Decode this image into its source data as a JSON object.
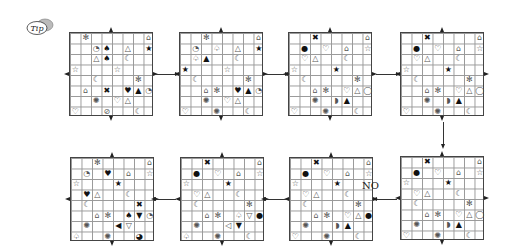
{
  "tip_label": "Tip",
  "no_label": "NO",
  "grids": [
    {
      "id": "g1",
      "x": 69,
      "y": 32,
      "cells": [
        [
          0,
          1,
          "✻"
        ],
        [
          0,
          7,
          "⌂"
        ],
        [
          1,
          2,
          "◔"
        ],
        [
          1,
          3,
          "♠"
        ],
        [
          1,
          5,
          "△"
        ],
        [
          1,
          7,
          "★"
        ],
        [
          2,
          2,
          "△"
        ],
        [
          2,
          3,
          "♠"
        ],
        [
          2,
          5,
          "☾"
        ],
        [
          3,
          0,
          "☆"
        ],
        [
          3,
          4,
          "☆"
        ],
        [
          4,
          2,
          "☾"
        ],
        [
          4,
          6,
          "✻"
        ],
        [
          5,
          1,
          "⌂"
        ],
        [
          5,
          3,
          "✖"
        ],
        [
          5,
          5,
          "♥"
        ],
        [
          5,
          6,
          "▲"
        ],
        [
          5,
          7,
          "◔"
        ],
        [
          6,
          2,
          "✺"
        ],
        [
          6,
          4,
          "♡"
        ],
        [
          6,
          5,
          "△"
        ],
        [
          7,
          0,
          "♡"
        ],
        [
          7,
          3,
          "⊘"
        ],
        [
          7,
          6,
          "☾"
        ]
      ]
    },
    {
      "id": "g2",
      "x": 179,
      "y": 32,
      "cells": [
        [
          0,
          2,
          "✻"
        ],
        [
          0,
          7,
          "⌂"
        ],
        [
          1,
          1,
          "◔"
        ],
        [
          1,
          3,
          "♤"
        ],
        [
          1,
          5,
          "△"
        ],
        [
          1,
          7,
          "★"
        ],
        [
          2,
          1,
          "♤"
        ],
        [
          2,
          2,
          "▲"
        ],
        [
          2,
          5,
          "☾"
        ],
        [
          3,
          0,
          "★"
        ],
        [
          3,
          4,
          "☆"
        ],
        [
          4,
          1,
          "☾"
        ],
        [
          4,
          6,
          "✻"
        ],
        [
          5,
          2,
          "⌂"
        ],
        [
          5,
          3,
          "✻"
        ],
        [
          5,
          5,
          "♥"
        ],
        [
          5,
          6,
          "▲"
        ],
        [
          5,
          7,
          "◔"
        ],
        [
          6,
          2,
          "✺"
        ],
        [
          6,
          4,
          "♡"
        ],
        [
          6,
          5,
          "△"
        ],
        [
          7,
          0,
          "♡"
        ],
        [
          7,
          3,
          "✺"
        ],
        [
          7,
          6,
          "☾"
        ]
      ]
    },
    {
      "id": "g3",
      "x": 288,
      "y": 32,
      "cells": [
        [
          0,
          2,
          "✖"
        ],
        [
          0,
          7,
          "⌂"
        ],
        [
          1,
          1,
          "●"
        ],
        [
          1,
          3,
          "♡"
        ],
        [
          1,
          5,
          "⌂"
        ],
        [
          1,
          7,
          "☆"
        ],
        [
          2,
          1,
          "♡"
        ],
        [
          2,
          2,
          "△"
        ],
        [
          2,
          5,
          "☾"
        ],
        [
          3,
          0,
          "☆"
        ],
        [
          3,
          4,
          "★"
        ],
        [
          4,
          1,
          "☾"
        ],
        [
          4,
          6,
          "✻"
        ],
        [
          5,
          2,
          "⌂"
        ],
        [
          5,
          3,
          "✻"
        ],
        [
          5,
          5,
          "♡"
        ],
        [
          5,
          6,
          "△"
        ],
        [
          5,
          7,
          "◯"
        ],
        [
          6,
          2,
          "✺"
        ],
        [
          6,
          4,
          "◗"
        ],
        [
          6,
          5,
          "▲"
        ],
        [
          7,
          0,
          "♡"
        ],
        [
          7,
          3,
          "✺"
        ],
        [
          7,
          6,
          "☾"
        ]
      ]
    },
    {
      "id": "g4",
      "x": 400,
      "y": 32,
      "cells": [
        [
          0,
          2,
          "✖"
        ],
        [
          0,
          7,
          "⌂"
        ],
        [
          1,
          1,
          "●"
        ],
        [
          1,
          3,
          "♡"
        ],
        [
          1,
          5,
          "⌂"
        ],
        [
          1,
          7,
          "☆"
        ],
        [
          2,
          1,
          "♡"
        ],
        [
          2,
          2,
          "△"
        ],
        [
          2,
          5,
          "☾"
        ],
        [
          3,
          0,
          "☆"
        ],
        [
          3,
          4,
          "★"
        ],
        [
          4,
          1,
          "☾"
        ],
        [
          4,
          6,
          "✻"
        ],
        [
          5,
          2,
          "⌂"
        ],
        [
          5,
          3,
          "✻"
        ],
        [
          5,
          5,
          "♡"
        ],
        [
          5,
          6,
          "△"
        ],
        [
          5,
          7,
          "◯"
        ],
        [
          6,
          2,
          "✺"
        ],
        [
          6,
          4,
          "◗"
        ],
        [
          6,
          5,
          "▲"
        ],
        [
          7,
          0,
          "♡"
        ],
        [
          7,
          3,
          "✺"
        ],
        [
          7,
          6,
          "☾"
        ]
      ]
    },
    {
      "id": "g5",
      "x": 70,
      "y": 157,
      "cells": [
        [
          0,
          2,
          "✻"
        ],
        [
          0,
          7,
          "⌂"
        ],
        [
          1,
          1,
          "◔"
        ],
        [
          1,
          3,
          "♥"
        ],
        [
          1,
          5,
          "⌂"
        ],
        [
          1,
          7,
          "☆"
        ],
        [
          2,
          0,
          "☆"
        ],
        [
          2,
          4,
          "★"
        ],
        [
          3,
          1,
          "♥"
        ],
        [
          3,
          2,
          "△"
        ],
        [
          3,
          5,
          "☾"
        ],
        [
          4,
          1,
          "☾"
        ],
        [
          4,
          6,
          "✖"
        ],
        [
          5,
          2,
          "⌂"
        ],
        [
          5,
          3,
          "✻"
        ],
        [
          5,
          5,
          "♠"
        ],
        [
          5,
          6,
          "▼"
        ],
        [
          5,
          7,
          "◔"
        ],
        [
          6,
          1,
          "✺"
        ],
        [
          6,
          4,
          "◀"
        ],
        [
          6,
          5,
          "▽"
        ],
        [
          7,
          0,
          "♤"
        ],
        [
          7,
          3,
          "✺"
        ],
        [
          7,
          6,
          "◕"
        ]
      ]
    },
    {
      "id": "g6",
      "x": 180,
      "y": 157,
      "cells": [
        [
          0,
          2,
          "✖"
        ],
        [
          0,
          7,
          "⌂"
        ],
        [
          1,
          1,
          "●"
        ],
        [
          1,
          3,
          "♡"
        ],
        [
          1,
          5,
          "⌂"
        ],
        [
          1,
          7,
          "☆"
        ],
        [
          2,
          0,
          "☆"
        ],
        [
          2,
          4,
          "★"
        ],
        [
          3,
          1,
          "♡"
        ],
        [
          3,
          2,
          "△"
        ],
        [
          3,
          5,
          "☾"
        ],
        [
          4,
          1,
          "☾"
        ],
        [
          4,
          6,
          "✻"
        ],
        [
          5,
          2,
          "⌂"
        ],
        [
          5,
          3,
          "✻"
        ],
        [
          5,
          5,
          "♤"
        ],
        [
          5,
          6,
          "▽"
        ],
        [
          5,
          7,
          "●"
        ],
        [
          6,
          1,
          "✺"
        ],
        [
          6,
          4,
          "◁"
        ],
        [
          6,
          5,
          "▼"
        ],
        [
          7,
          0,
          "♤"
        ],
        [
          7,
          3,
          "✺"
        ],
        [
          7,
          6,
          "☾"
        ]
      ]
    },
    {
      "id": "g7",
      "x": 289,
      "y": 157,
      "cells": [
        [
          0,
          2,
          "✖"
        ],
        [
          0,
          7,
          "⌂"
        ],
        [
          1,
          1,
          "●"
        ],
        [
          1,
          3,
          "♡"
        ],
        [
          1,
          5,
          "⌂"
        ],
        [
          1,
          7,
          "☆"
        ],
        [
          2,
          0,
          "☆"
        ],
        [
          2,
          4,
          "★"
        ],
        [
          3,
          1,
          "♡"
        ],
        [
          3,
          2,
          "△"
        ],
        [
          3,
          5,
          "☾"
        ],
        [
          4,
          1,
          "☾"
        ],
        [
          4,
          6,
          "✻"
        ],
        [
          5,
          2,
          "⌂"
        ],
        [
          5,
          3,
          "✻"
        ],
        [
          5,
          5,
          "♡"
        ],
        [
          5,
          6,
          "△"
        ],
        [
          5,
          7,
          "●"
        ],
        [
          6,
          1,
          "✺"
        ],
        [
          6,
          4,
          "◗"
        ],
        [
          6,
          5,
          "▲"
        ],
        [
          7,
          0,
          "♡"
        ],
        [
          7,
          3,
          "✺"
        ],
        [
          7,
          6,
          "☾"
        ]
      ]
    },
    {
      "id": "g8",
      "x": 400,
      "y": 156,
      "cells": [
        [
          0,
          2,
          "✖"
        ],
        [
          0,
          7,
          "⌂"
        ],
        [
          1,
          1,
          "●"
        ],
        [
          1,
          3,
          "♡"
        ],
        [
          1,
          5,
          "⌂"
        ],
        [
          1,
          7,
          "☆"
        ],
        [
          2,
          0,
          "☆"
        ],
        [
          2,
          4,
          "★"
        ],
        [
          3,
          1,
          "♡"
        ],
        [
          3,
          2,
          "△"
        ],
        [
          3,
          5,
          "☾"
        ],
        [
          4,
          1,
          "☾"
        ],
        [
          4,
          6,
          "✻"
        ],
        [
          5,
          2,
          "⌂"
        ],
        [
          5,
          3,
          "✻"
        ],
        [
          5,
          5,
          "♡"
        ],
        [
          5,
          6,
          "△"
        ],
        [
          5,
          7,
          "◯"
        ],
        [
          6,
          1,
          "✺"
        ],
        [
          6,
          4,
          "◗"
        ],
        [
          6,
          5,
          "▲"
        ],
        [
          7,
          0,
          "♡"
        ],
        [
          7,
          3,
          "✺"
        ],
        [
          7,
          6,
          "☾"
        ]
      ]
    }
  ],
  "arrows": [
    {
      "dir": "right",
      "x": 155,
      "y": 74,
      "len": 20
    },
    {
      "dir": "right",
      "x": 265,
      "y": 74,
      "len": 20
    },
    {
      "dir": "right",
      "x": 376,
      "y": 74,
      "len": 20
    },
    {
      "dir": "down",
      "x": 443,
      "y": 122,
      "len": 22
    },
    {
      "dir": "left",
      "x": 377,
      "y": 199,
      "len": 20
    },
    {
      "dir": "left",
      "x": 266,
      "y": 199,
      "len": 20
    },
    {
      "dir": "left",
      "x": 156,
      "y": 199,
      "len": 20
    }
  ],
  "no_pos": {
    "x": 362,
    "y": 180
  }
}
